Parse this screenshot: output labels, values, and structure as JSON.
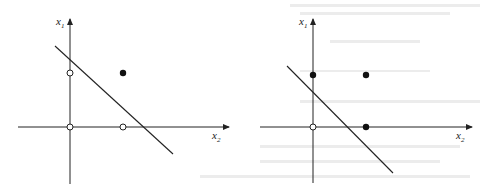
{
  "figure": {
    "panels": [
      {
        "id": "left",
        "x_axis_label": "x",
        "x_axis_subscript": "2",
        "y_axis_label": "x",
        "y_axis_subscript": "1",
        "points": [
          {
            "pos": "(0,0)",
            "fill": "open"
          },
          {
            "pos": "(0,1)",
            "fill": "open"
          },
          {
            "pos": "(1,0)",
            "fill": "open"
          },
          {
            "pos": "(1,1)",
            "fill": "filled"
          }
        ],
        "decision_line": "separates (1,1) from others"
      },
      {
        "id": "right",
        "x_axis_label": "x",
        "x_axis_subscript": "2",
        "y_axis_label": "x",
        "y_axis_subscript": "1",
        "points": [
          {
            "pos": "(0,0)",
            "fill": "open"
          },
          {
            "pos": "(0,1)",
            "fill": "filled"
          },
          {
            "pos": "(1,0)",
            "fill": "filled"
          },
          {
            "pos": "(1,1)",
            "fill": "filled"
          }
        ],
        "decision_line": "separates (0,0) from others"
      }
    ],
    "colors": {
      "ink": "#222222",
      "background": "#ffffff"
    }
  }
}
